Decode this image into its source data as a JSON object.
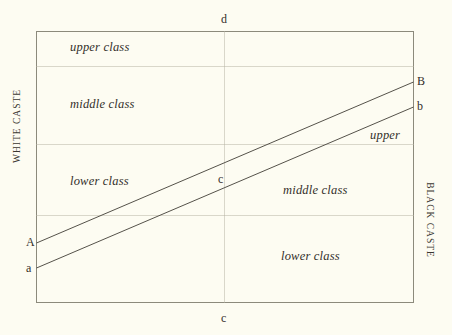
{
  "diagram": {
    "title_alt": "Caste and class diagram",
    "axis_captions": {
      "left": "WHITE CASTE",
      "right": "BLACK CASTE"
    },
    "point_labels": {
      "top_center": "d",
      "bottom_center": "c",
      "center": "c",
      "line_upper_start": "A",
      "line_upper_end": "B",
      "line_lower_start": "a",
      "line_lower_end": "b"
    },
    "white_regions": [
      {
        "key": "white_upper",
        "label": "upper class"
      },
      {
        "key": "white_middle",
        "label": "middle class"
      },
      {
        "key": "white_lower",
        "label": "lower class"
      }
    ],
    "black_regions": [
      {
        "key": "black_upper",
        "label": "upper"
      },
      {
        "key": "black_middle",
        "label": "middle class"
      },
      {
        "key": "black_lower",
        "label": "lower class"
      }
    ],
    "colors": {
      "background": "#fdfcf2",
      "frame": "#8c8a7c",
      "gridline": "#b5b2a2",
      "diagonal": "#55524a",
      "text": "#332f2a"
    }
  }
}
